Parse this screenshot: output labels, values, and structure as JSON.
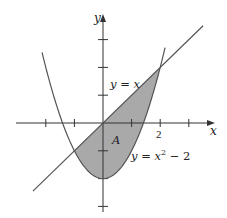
{
  "chart_data": {
    "type": "line",
    "title": "",
    "xlabel": "x",
    "ylabel": "y",
    "xlim": [
      -3.6,
      4.3
    ],
    "ylim": [
      -3.4,
      4.3
    ],
    "x_ticks": [
      -2,
      -1,
      1,
      2,
      3
    ],
    "y_ticks": [
      -3,
      -2,
      -1,
      1,
      2,
      3
    ],
    "tick_labels": {
      "x": [
        {
          "value": 2,
          "label": "2"
        }
      ]
    },
    "series": [
      {
        "name": "y = x",
        "expr": "x",
        "x": [
          -2.4,
          -1,
          0,
          1,
          2,
          3.6
        ],
        "y": [
          -2.4,
          -1,
          0,
          1,
          2,
          3.6
        ]
      },
      {
        "name": "y = x^2 - 2",
        "expr": "x^2 - 2",
        "x": [
          -2.1,
          -1,
          0,
          1,
          2,
          2.2
        ],
        "y": [
          2.41,
          -1,
          -2,
          -1,
          2,
          2.84
        ]
      }
    ],
    "shaded_region": {
      "label": "A",
      "between": [
        "y = x",
        "y = x^2 - 2"
      ],
      "x_range": [
        -1,
        2
      ],
      "color": "#a6a6a6"
    },
    "intersections": [
      [
        -1,
        -1
      ],
      [
        2,
        2
      ]
    ],
    "annotations": [
      {
        "text": "y = x",
        "near": [
          0.9,
          1.2
        ]
      },
      {
        "text": "y = x² − 2",
        "near": [
          1.7,
          -1.1
        ]
      },
      {
        "text": "A",
        "near": [
          0.4,
          -0.6
        ]
      }
    ],
    "grid": false,
    "legend": "none"
  },
  "labels": {
    "x_axis": "x",
    "y_axis": "y",
    "tick_2": "2",
    "line_label": "y = x",
    "parabola_label_base": "y = x",
    "parabola_label_exp": "2",
    "parabola_label_tail": " − 2",
    "region_label": "A"
  },
  "colors": {
    "curve": "#555555",
    "fill": "#a9a9a9",
    "axis": "#333333"
  }
}
